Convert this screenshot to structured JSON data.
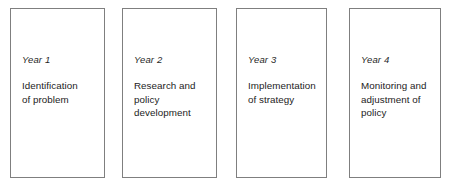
{
  "diagram": {
    "background_color": "#ffffff",
    "box_border_color": "#7f7f7f",
    "text_color": "#1c1c1c",
    "boxes": [
      {
        "year_label": "Year 1",
        "description": "Identification\nof problem",
        "x": 10,
        "y": 8,
        "width": 95,
        "height": 170
      },
      {
        "year_label": "Year 2",
        "description": "Research and\npolicy\ndevelopment",
        "x": 122,
        "y": 8,
        "width": 95,
        "height": 170
      },
      {
        "year_label": "Year 3",
        "description": "Implementation\nof strategy",
        "x": 236,
        "y": 8,
        "width": 91,
        "height": 170
      },
      {
        "year_label": "Year 4",
        "description": "Monitoring and\nadjustment of\npolicy",
        "x": 349,
        "y": 8,
        "width": 92,
        "height": 170
      }
    ]
  }
}
